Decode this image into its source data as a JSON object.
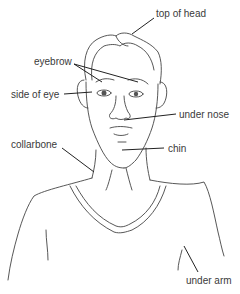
{
  "diagram": {
    "type": "labeled-illustration",
    "labels": [
      {
        "id": "top-of-head",
        "text": "top of head"
      },
      {
        "id": "eyebrow",
        "text": "eyebrow"
      },
      {
        "id": "side-of-eye",
        "text": "side of eye"
      },
      {
        "id": "under-nose",
        "text": "under nose"
      },
      {
        "id": "collarbone",
        "text": "collarbone"
      },
      {
        "id": "chin",
        "text": "chin"
      },
      {
        "id": "under-arm",
        "text": "under arm"
      }
    ]
  },
  "colors": {
    "background": "#ffffff",
    "line": "#444444",
    "text": "#3a3a3a"
  }
}
